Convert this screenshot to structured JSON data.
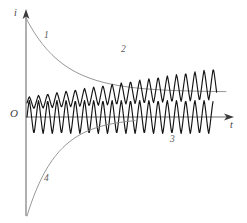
{
  "figure": {
    "background_color": "#ffffff",
    "axes": {
      "y_axis_label": "i",
      "x_axis_label": "t",
      "origin_label": "O",
      "axis_color": "#6e6e6e",
      "arrowhead_color": "#3a3a3a"
    },
    "curve_labels": {
      "curve1": "1",
      "curve2": "2",
      "curve3": "3",
      "curve4": "4"
    },
    "colors": {
      "envelope": "#8a8a8a",
      "oscillation": "#141414",
      "label": "#5a5a5a"
    }
  },
  "chart_data": {
    "type": "line",
    "xlabel": "t",
    "ylabel": "i",
    "grid": false,
    "legend": "inline-curve-numbers",
    "xlim": [
      0,
      232
    ],
    "ylim": [
      0,
      223
    ],
    "origin_px": {
      "x": 26,
      "y": 117
    },
    "series": [
      {
        "name": "1",
        "label": "1",
        "style": "thin-gray",
        "description": "Decaying exponential envelope starting high on the i-axis and approaching a horizontal asymptote",
        "start_px": {
          "x": 26,
          "y": 18
        },
        "asymptote_y_px": 92,
        "end_x_px": 226,
        "decay_constant_px": 38,
        "amplitude_px": 74
      },
      {
        "name": "2",
        "label": "2",
        "style": "thick-black-oscillation",
        "description": "Oscillation whose peaks ride along curve 1 while its mean level rises toward the asymptote",
        "start_x_px": 27,
        "end_x_px": 217,
        "period_px": 9.2,
        "start_center_y_px": 103,
        "end_center_y_px": 84,
        "start_amplitude_px": 6,
        "end_amplitude_px": 16
      },
      {
        "name": "3",
        "label": "3",
        "style": "thick-black-oscillation",
        "description": "Sustained constant-amplitude oscillation centred on the t-axis",
        "start_x_px": 27,
        "end_x_px": 213,
        "period_px": 9.2,
        "center_y_px": 117,
        "amplitude_px": 17
      },
      {
        "name": "4",
        "label": "4",
        "style": "thin-gray",
        "description": "Rising exponential approaching the t-axis from below",
        "start_px": {
          "x": 27,
          "y": 216
        },
        "asymptote_y_px": 118,
        "end_x_px": 135,
        "rise_constant_px": 30,
        "amplitude_px": 98
      }
    ],
    "annotations": [
      {
        "text": "1",
        "x_px": 46,
        "y_px": 36
      },
      {
        "text": "2",
        "x_px": 123,
        "y_px": 50
      },
      {
        "text": "3",
        "x_px": 172,
        "y_px": 140
      },
      {
        "text": "4",
        "x_px": 46,
        "y_px": 179
      },
      {
        "text": "i",
        "x_px": 17,
        "y_px": 14
      },
      {
        "text": "t",
        "x_px": 231,
        "y_px": 124
      },
      {
        "text": "O",
        "x_px": 14,
        "y_px": 112
      }
    ]
  }
}
